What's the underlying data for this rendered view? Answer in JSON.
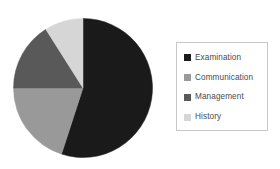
{
  "chart_data": {
    "type": "pie",
    "title": "",
    "subtitle": "",
    "xlabel": "",
    "ylabel": "",
    "grid": false,
    "legend_position": "right",
    "start_angle_deg": 0,
    "direction": "clockwise",
    "categories": [
      "Examination",
      "Communication",
      "Management",
      "History"
    ],
    "values": [
      55,
      20,
      16,
      9
    ],
    "units": "percent",
    "colors": [
      "#1a1a1a",
      "#999999",
      "#595959",
      "#d6d6d6"
    ],
    "slices": [
      {
        "label": "Examination",
        "value": 55,
        "color": "#1a1a1a",
        "start_deg": 0,
        "end_deg": 198
      },
      {
        "label": "Communication",
        "value": 20,
        "color": "#999999",
        "start_deg": 198,
        "end_deg": 270
      },
      {
        "label": "Management",
        "value": 16,
        "color": "#595959",
        "start_deg": 270,
        "end_deg": 327.6
      },
      {
        "label": "History",
        "value": 9,
        "color": "#d6d6d6",
        "start_deg": 327.6,
        "end_deg": 360
      }
    ]
  },
  "legend": {
    "items": [
      {
        "label": "Examination",
        "color": "#1a1a1a"
      },
      {
        "label": "Communication",
        "color": "#999999"
      },
      {
        "label": "Management",
        "color": "#595959"
      },
      {
        "label": "History",
        "color": "#d6d6d6"
      }
    ],
    "border_color": "#c8c8c8",
    "text_color": "#4a4a4a"
  },
  "figure": {
    "background": "#ffffff"
  }
}
